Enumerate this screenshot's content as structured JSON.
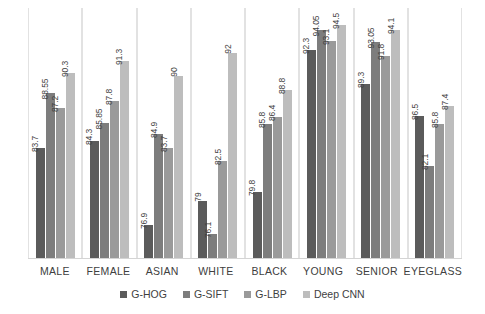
{
  "chart_data": {
    "type": "bar",
    "title": "",
    "xlabel": "",
    "ylabel": "",
    "grid": "vertical-category-separators",
    "legend_position": "bottom",
    "ylim": [
      74,
      96
    ],
    "categories": [
      "MALE",
      "FEMALE",
      "ASIAN",
      "WHITE",
      "BLACK",
      "YOUNG",
      "SENIOR",
      "EYEGLASS"
    ],
    "series": [
      {
        "name": "G-HOG",
        "color": "#5b5b5b",
        "values": [
          83.7,
          84.3,
          76.9,
          79,
          79.8,
          92.3,
          89.3,
          86.5
        ]
      },
      {
        "name": "G-SIFT",
        "color": "#7d7d7d",
        "values": [
          88.55,
          85.85,
          84.9,
          76.1,
          85.8,
          94.05,
          93.05,
          82.1
        ]
      },
      {
        "name": "G-LBP",
        "color": "#9a9a9a",
        "values": [
          87.2,
          87.8,
          83.7,
          82.5,
          86.4,
          93.1,
          91.8,
          85.8
        ]
      },
      {
        "name": "Deep CNN",
        "color": "#bdbdbd",
        "values": [
          90.3,
          91.3,
          90,
          92,
          88.8,
          94.5,
          94.1,
          87.4
        ]
      }
    ],
    "value_labels": [
      [
        "83.7",
        "88.55",
        "87.2",
        "90.3"
      ],
      [
        "84.3",
        "85.85",
        "87.8",
        "91.3"
      ],
      [
        "76.9",
        "84.9",
        "83.7",
        "90"
      ],
      [
        "79",
        "76.1",
        "82.5",
        "92"
      ],
      [
        "79.8",
        "85.8",
        "86.4",
        "88.8"
      ],
      [
        "92.3",
        "94.05",
        "93.1",
        "94.5"
      ],
      [
        "89.3",
        "93.05",
        "91.8",
        "94.1"
      ],
      [
        "86.5",
        "82.1",
        "85.8",
        "87.4"
      ]
    ]
  },
  "legend": {
    "items": [
      {
        "label": "G-HOG"
      },
      {
        "label": "G-SIFT"
      },
      {
        "label": "G-LBP"
      },
      {
        "label": "Deep CNN"
      }
    ]
  }
}
